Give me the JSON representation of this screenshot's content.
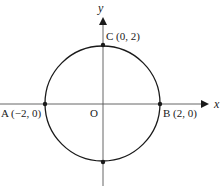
{
  "diagram": {
    "axes": {
      "x_label": "x",
      "y_label": "y",
      "origin_label": "O"
    },
    "circle": {
      "center": [
        0,
        0
      ],
      "radius": 2
    },
    "points": [
      {
        "name": "A",
        "label": "A (−2, 0)",
        "coords": [
          -2,
          0
        ]
      },
      {
        "name": "B",
        "label": "B (2, 0)",
        "coords": [
          2,
          0
        ]
      },
      {
        "name": "C",
        "label": "C (0, 2)",
        "coords": [
          0,
          2
        ]
      },
      {
        "name": "D",
        "label": "",
        "coords": [
          0,
          -2
        ]
      }
    ],
    "colors": {
      "stroke": "#1a1a1a",
      "background": "#ffffff"
    }
  }
}
